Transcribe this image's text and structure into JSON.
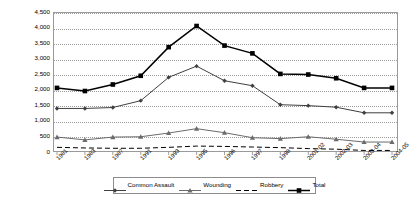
{
  "chart_data": {
    "type": "line",
    "title": "",
    "subtitle": "",
    "xlabel": "",
    "ylabel": "",
    "ylim": [
      0,
      4500
    ],
    "ytick_step": 500,
    "yticks": [
      "0",
      "500",
      "1,000",
      "1,500",
      "2,000",
      "2,500",
      "3,000",
      "3,500",
      "4,000",
      "4,500"
    ],
    "ytick_values": [
      0,
      500,
      1000,
      1500,
      2000,
      2500,
      3000,
      3500,
      4000,
      4500
    ],
    "grid": true,
    "grid_style": "dotted-horizontal",
    "legend_position": "bottom",
    "categories": [
      "1981",
      "1983",
      "1987",
      "1991",
      "1993",
      "1995",
      "1996",
      "1997",
      "1998",
      "2001-02",
      "2002-03",
      "2003-04",
      "2004-05"
    ],
    "series": [
      {
        "name": "Common Assault",
        "marker": "diamond",
        "line": "solid",
        "color": "#3f3f3f",
        "values": [
          1400,
          1400,
          1430,
          1650,
          2400,
          2760,
          2290,
          2130,
          1520,
          1490,
          1440,
          1260,
          1260
        ]
      },
      {
        "name": "Wounding",
        "marker": "triangle",
        "line": "solid",
        "color": "#6b6b6b",
        "values": [
          480,
          390,
          480,
          490,
          610,
          750,
          620,
          460,
          430,
          490,
          410,
          320,
          320
        ]
      },
      {
        "name": "Robbery",
        "marker": "none",
        "line": "dashed",
        "color": "#000000",
        "values": [
          150,
          130,
          120,
          120,
          150,
          190,
          180,
          160,
          140,
          110,
          90,
          50,
          50
        ]
      },
      {
        "name": "Total",
        "marker": "square",
        "line": "solid",
        "color": "#000000",
        "values": [
          2060,
          1960,
          2170,
          2450,
          3370,
          4050,
          3420,
          3170,
          2510,
          2490,
          2370,
          2060,
          2060
        ]
      }
    ]
  },
  "legend": {
    "items": [
      {
        "label": "Common Assault"
      },
      {
        "label": "Wounding"
      },
      {
        "label": "Robbery"
      },
      {
        "label": "Total"
      }
    ]
  }
}
